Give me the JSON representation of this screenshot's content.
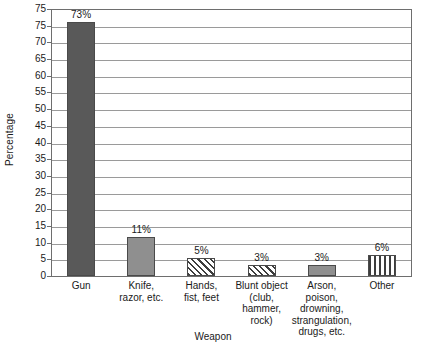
{
  "chart_data": {
    "type": "bar",
    "title": "",
    "xlabel": "Weapon",
    "ylabel": "Percentage",
    "ylim": [
      0,
      75
    ],
    "ystep": 5,
    "grid": true,
    "legend": "none",
    "categories": [
      "Gun",
      "Knife,\nrazor, etc.",
      "Hands,\nfist, feet",
      "Blunt object\n(club,\nhammer,\nrock)",
      "Arson, poison,\ndrowning,\nstrangulation,\ndrugs, etc.",
      "Other"
    ],
    "values": [
      73,
      11,
      5,
      3,
      3,
      6
    ],
    "data_labels": [
      "73%",
      "11%",
      "5%",
      "3%",
      "3%",
      "6%"
    ],
    "ytick_labels": [
      "75",
      "75",
      "70",
      "65",
      "60",
      "55",
      "50",
      "45",
      "40",
      "35",
      "30",
      "25",
      "20",
      "15",
      "10",
      "5",
      "0"
    ],
    "bar_styles": [
      "solid-dark",
      "solid-mid",
      "diagonal-hatch",
      "diagonal-hatch",
      "solid-mid",
      "vertical-stripe"
    ],
    "colors": {
      "solid_dark": "#595959",
      "solid_mid": "#8f8f8f",
      "hatch_line": "#3d3d3d",
      "gridline": "#9a9a9a",
      "frame": "#6e6e6e",
      "background": "#ffffff",
      "text": "#1a1a1a"
    }
  }
}
